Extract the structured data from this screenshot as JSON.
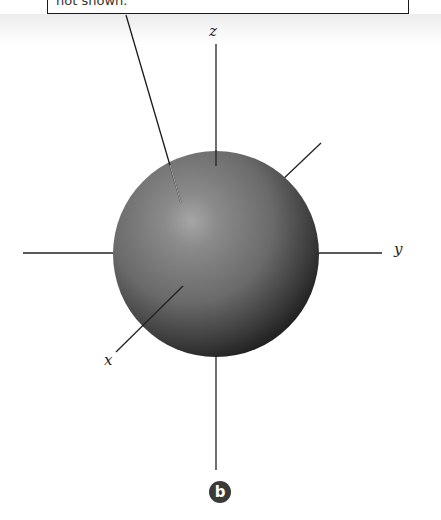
{
  "callout": {
    "text": "not shown."
  },
  "axes": {
    "x_label": "x",
    "y_label": "y",
    "z_label": "z"
  },
  "panel_badge": {
    "label": "b",
    "color": "#3a3a3a"
  },
  "sphere": {
    "base_color": "#6e6e6e",
    "highlight_color": "#a8a8a8",
    "shadow_color": "#1c1c1c"
  }
}
